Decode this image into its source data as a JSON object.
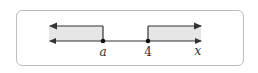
{
  "diagram": {
    "type": "number-line",
    "axis_label": "x",
    "points": [
      {
        "label": "a",
        "italic": true,
        "filled": true
      },
      {
        "label": "4",
        "italic": false,
        "filled": true
      }
    ],
    "regions": [
      {
        "name": "left-ray",
        "from": "-inf",
        "to": "a",
        "direction": "left"
      },
      {
        "name": "right-ray",
        "from": "4",
        "to": "+inf",
        "direction": "right"
      }
    ],
    "colors": {
      "line": "#333333",
      "shade": "#e6e6e6",
      "frame": "#bdbdbd"
    }
  }
}
